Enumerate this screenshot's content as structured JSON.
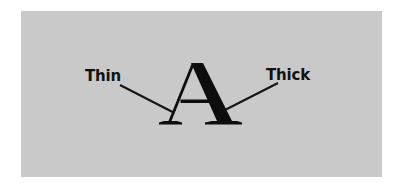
{
  "figure": {
    "kind": "typography-stroke-contrast-diagram",
    "background_color": "#ffffff",
    "panel_color": "#c9c9c9",
    "ink_color": "#0d0d0d"
  },
  "glyph": {
    "character": "A",
    "style": "serif-capital",
    "thin_stroke_side": "left",
    "thick_stroke_side": "right"
  },
  "annotations": {
    "left": {
      "label": "Thin",
      "points_to": "left-diagonal-stroke"
    },
    "right": {
      "label": "Thick",
      "points_to": "right-diagonal-stroke"
    }
  }
}
